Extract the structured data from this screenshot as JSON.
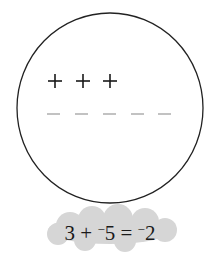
{
  "diagram": {
    "circle": {
      "stroke": "#222222"
    },
    "positive_charges": {
      "count": 3,
      "symbol": "+",
      "color": "#1a1a1a"
    },
    "negative_charges": {
      "count": 5,
      "symbol": "−",
      "color": "#999999"
    },
    "equation": {
      "a": "3",
      "op": "+",
      "b_sign": "−",
      "b": "5",
      "eq": "=",
      "result_sign": "−",
      "result": "2"
    },
    "cloud_color": "#d6d6d6"
  }
}
